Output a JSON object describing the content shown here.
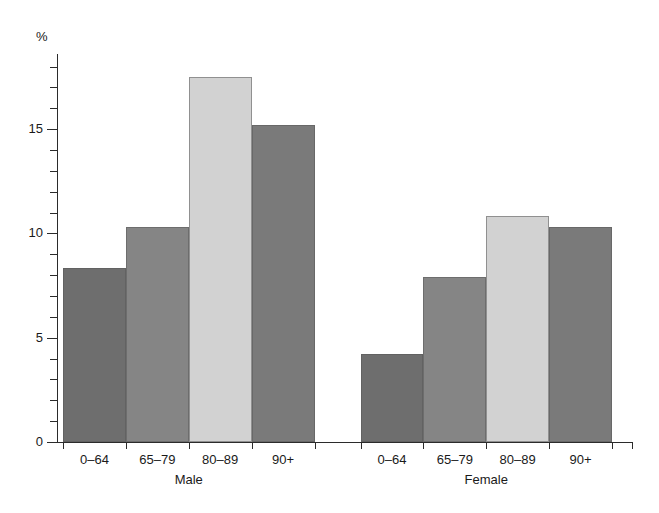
{
  "chart_data": {
    "type": "bar",
    "title": "",
    "xlabel": "",
    "ylabel": "%",
    "ylim": [
      0,
      18.6
    ],
    "yticks": [
      0,
      5,
      10,
      15
    ],
    "ytick_labels": [
      "0",
      "5",
      "10",
      "15"
    ],
    "minor_tick_step": 1,
    "grid": false,
    "legend": "none",
    "categories": [
      "0–64",
      "65–79",
      "80–89",
      "90+"
    ],
    "groups": [
      {
        "name": "Male",
        "label": "Male",
        "values": [
          8.35,
          10.3,
          17.5,
          15.2
        ],
        "bar_colors": [
          "#6e6e6e",
          "#858585",
          "#d2d2d2",
          "#7a7a7a"
        ]
      },
      {
        "name": "Female",
        "label": "Female",
        "values": [
          4.2,
          7.9,
          10.85,
          10.3
        ],
        "bar_colors": [
          "#6e6e6e",
          "#858585",
          "#d2d2d2",
          "#7a7a7a"
        ]
      }
    ],
    "colors": {
      "dark_gray": "#6e6e6e",
      "medium_gray": "#858585",
      "light_gray": "#d2d2d2",
      "axis": "#2b2b2b",
      "background": "#ffffff"
    }
  }
}
